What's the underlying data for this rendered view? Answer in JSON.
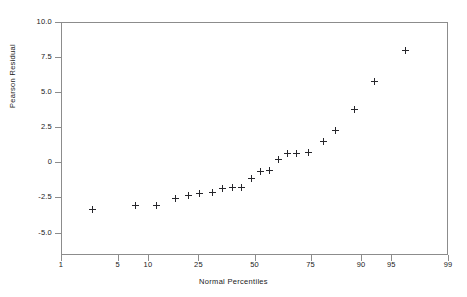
{
  "chart_data": {
    "type": "scatter",
    "title": "",
    "xlabel": "Normal Percentiles",
    "ylabel": "Pearson Residual",
    "x_scale": "normal-probability",
    "grid": false,
    "legend": null,
    "xlim": [
      1,
      99
    ],
    "ylim": [
      -6.6,
      10.0
    ],
    "x_ticks": [
      1,
      5,
      10,
      25,
      50,
      75,
      90,
      95,
      99
    ],
    "x_tick_labels": [
      "1",
      "5",
      "10",
      "25",
      "50",
      "75",
      "90",
      "95",
      "99"
    ],
    "y_ticks": [
      10.0,
      7.5,
      5.0,
      2.5,
      0,
      -2.5,
      -5.0
    ],
    "y_tick_labels": [
      "10.0",
      "7.5",
      "5.0",
      "2.5",
      "0",
      "-2.5",
      "-5.0"
    ],
    "marker": "plus",
    "marker_color": "#26262b",
    "frame_color": "#8c8c8c",
    "background_color": "#ffffff",
    "points": [
      {
        "percentile": 2.6,
        "residual": -3.38
      },
      {
        "percentile": 7.6,
        "residual": -3.1
      },
      {
        "percentile": 12.0,
        "residual": -3.05
      },
      {
        "percentile": 17.0,
        "residual": -2.6
      },
      {
        "percentile": 21.5,
        "residual": -2.35
      },
      {
        "percentile": 25.5,
        "residual": -2.2
      },
      {
        "percentile": 30.5,
        "residual": -2.15
      },
      {
        "percentile": 35.0,
        "residual": -1.85
      },
      {
        "percentile": 39.5,
        "residual": -1.8
      },
      {
        "percentile": 44.0,
        "residual": -1.8
      },
      {
        "percentile": 48.5,
        "residual": -1.15
      },
      {
        "percentile": 53.0,
        "residual": -0.62
      },
      {
        "percentile": 57.0,
        "residual": -0.6
      },
      {
        "percentile": 61.5,
        "residual": 0.22
      },
      {
        "percentile": 65.5,
        "residual": 0.65
      },
      {
        "percentile": 69.5,
        "residual": 0.65
      },
      {
        "percentile": 74.0,
        "residual": 0.72
      },
      {
        "percentile": 79.5,
        "residual": 1.5
      },
      {
        "percentile": 83.5,
        "residual": 2.25
      },
      {
        "percentile": 88.5,
        "residual": 3.78
      },
      {
        "percentile": 92.5,
        "residual": 5.78
      },
      {
        "percentile": 96.5,
        "residual": 8.0
      }
    ]
  },
  "axes": {
    "x_title": "Normal Percentiles",
    "y_title": "Pearson Residual"
  }
}
